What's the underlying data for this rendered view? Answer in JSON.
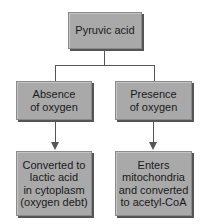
{
  "diagram": {
    "root": {
      "label": "Pyruvic acid"
    },
    "branches": [
      {
        "condition": "Absence\nof oxygen",
        "outcome": "Converted to\nlactic acid\nin cytoplasm\n(oxygen debt)"
      },
      {
        "condition": "Presence\nof oxygen",
        "outcome": "Enters\nmitochondria\nand converted\nto acetyl-CoA"
      }
    ]
  }
}
